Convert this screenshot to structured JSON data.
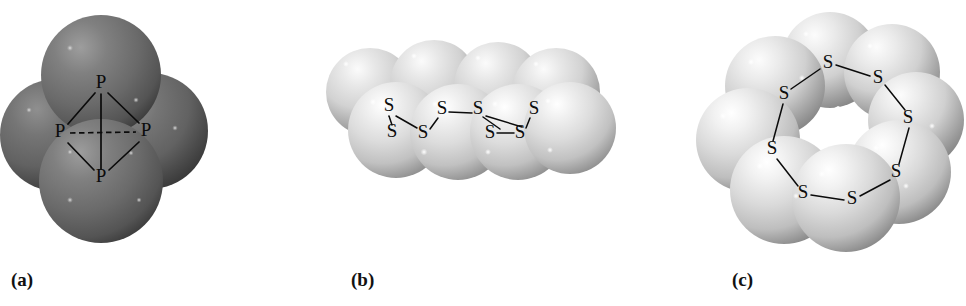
{
  "figure": {
    "background_color": "#ffffff",
    "width": 966,
    "height": 306,
    "panel_count": 3
  },
  "panels": [
    {
      "id": "a",
      "caption": "(a)",
      "molecule": "P4",
      "atom_symbol": "P",
      "atom_count": 4,
      "sphere_color": "#6e6e6e",
      "sphere_highlight_color": "#9a9a9a",
      "sphere_shadow_color": "#3b3b3b",
      "label_color": "#0c0c0c",
      "bond_color": "#0b0b0b",
      "geometry": "tetrahedron",
      "spheres": [
        {
          "cx": 101,
          "cy": 75,
          "r": 60
        },
        {
          "cx": 56,
          "cy": 135,
          "r": 56
        },
        {
          "cx": 150,
          "cy": 131,
          "r": 58
        },
        {
          "cx": 101,
          "cy": 181,
          "r": 62
        }
      ],
      "atoms": [
        {
          "symbol": "P",
          "x": 101,
          "y": 84,
          "name": "atom-p-top"
        },
        {
          "symbol": "P",
          "x": 60,
          "y": 133,
          "name": "atom-p-left"
        },
        {
          "symbol": "P",
          "x": 146,
          "y": 132,
          "name": "atom-p-right"
        },
        {
          "symbol": "P",
          "x": 101,
          "y": 178,
          "name": "atom-p-bottom"
        }
      ],
      "bonds": [
        {
          "from": "top",
          "to": "left",
          "style": "solid",
          "x1": 95,
          "y1": 93,
          "x2": 68,
          "y2": 124
        },
        {
          "from": "top",
          "to": "right",
          "style": "solid",
          "x1": 108,
          "y1": 93,
          "x2": 139,
          "y2": 123
        },
        {
          "from": "left",
          "to": "bottom",
          "style": "solid",
          "x1": 68,
          "y1": 143,
          "x2": 94,
          "y2": 170
        },
        {
          "from": "right",
          "to": "bottom",
          "style": "solid",
          "x1": 139,
          "y1": 142,
          "x2": 109,
          "y2": 170
        },
        {
          "from": "top",
          "to": "bottom",
          "style": "solid",
          "x1": 101,
          "y1": 94,
          "x2": 101,
          "y2": 169
        },
        {
          "from": "left",
          "to": "right",
          "style": "dashed",
          "x1": 70,
          "y1": 133,
          "x2": 136,
          "y2": 132
        }
      ]
    },
    {
      "id": "b",
      "caption": "(b)",
      "molecule": "S8",
      "atom_symbol": "S",
      "atom_count": 8,
      "view": "side view of crown ring",
      "sphere_color": "#d4d4d4",
      "sphere_highlight_color": "#fcfcfc",
      "sphere_shadow_color": "#8d8d8d",
      "label_color": "#0c0c0c",
      "bond_color": "#0b0b0b",
      "spheres": [
        {
          "cx": 48,
          "cy": 92,
          "r": 44,
          "row": "back"
        },
        {
          "cx": 112,
          "cy": 84,
          "r": 44,
          "row": "back"
        },
        {
          "cx": 176,
          "cy": 86,
          "r": 44,
          "row": "back"
        },
        {
          "cx": 234,
          "cy": 92,
          "r": 44,
          "row": "back"
        },
        {
          "cx": 74,
          "cy": 130,
          "r": 48,
          "row": "front"
        },
        {
          "cx": 136,
          "cy": 132,
          "r": 48,
          "row": "front"
        },
        {
          "cx": 196,
          "cy": 132,
          "r": 48,
          "row": "front"
        },
        {
          "cx": 246,
          "cy": 128,
          "r": 46,
          "row": "front"
        }
      ],
      "atoms": [
        {
          "symbol": "S",
          "x": 67,
          "y": 107,
          "name": "atom-s-1"
        },
        {
          "symbol": "S",
          "x": 70,
          "y": 133,
          "name": "atom-s-2"
        },
        {
          "symbol": "S",
          "x": 101,
          "y": 134,
          "name": "atom-s-3"
        },
        {
          "symbol": "S",
          "x": 120,
          "y": 110,
          "name": "atom-s-4"
        },
        {
          "symbol": "S",
          "x": 156,
          "y": 110,
          "name": "atom-s-5"
        },
        {
          "symbol": "S",
          "x": 168,
          "y": 134,
          "name": "atom-s-6"
        },
        {
          "symbol": "S",
          "x": 198,
          "y": 134,
          "name": "atom-s-7"
        },
        {
          "symbol": "S",
          "x": 207,
          "y": 110,
          "name": "atom-s-8"
        }
      ],
      "bonds": [
        {
          "x1": 67,
          "y1": 116,
          "x2": 70,
          "y2": 125
        },
        {
          "x1": 74,
          "y1": 116,
          "x2": 95,
          "y2": 128
        },
        {
          "x1": 108,
          "y1": 129,
          "x2": 115,
          "y2": 118
        },
        {
          "x1": 127,
          "y1": 112,
          "x2": 150,
          "y2": 113
        },
        {
          "x1": 161,
          "y1": 117,
          "x2": 180,
          "y2": 129
        },
        {
          "x1": 175,
          "y1": 133,
          "x2": 191,
          "y2": 133
        },
        {
          "x1": 204,
          "y1": 128,
          "x2": 207,
          "y2": 118
        },
        {
          "x1": 196,
          "y1": 129,
          "x2": 164,
          "y2": 117
        }
      ]
    },
    {
      "id": "c",
      "caption": "(c)",
      "molecule": "S8",
      "atom_symbol": "S",
      "atom_count": 8,
      "view": "top view of crown ring with central hole",
      "sphere_color": "#d2d2d2",
      "sphere_highlight_color": "#fcfcfc",
      "sphere_shadow_color": "#8a8a8a",
      "label_color": "#0c0c0c",
      "bond_color": "#0b0b0b",
      "hole": {
        "cx": 194,
        "cy": 122,
        "r": 15,
        "color": "#ffffff"
      },
      "spheres": [
        {
          "cx": 186,
          "cy": 60,
          "r": 48,
          "layer": "back"
        },
        {
          "cx": 248,
          "cy": 72,
          "r": 48,
          "layer": "back"
        },
        {
          "cx": 131,
          "cy": 86,
          "r": 50,
          "layer": "mid"
        },
        {
          "cx": 272,
          "cy": 120,
          "r": 48,
          "layer": "mid"
        },
        {
          "cx": 104,
          "cy": 140,
          "r": 52,
          "layer": "mid"
        },
        {
          "cx": 255,
          "cy": 172,
          "r": 52,
          "layer": "front"
        },
        {
          "cx": 140,
          "cy": 190,
          "r": 54,
          "layer": "front"
        },
        {
          "cx": 202,
          "cy": 198,
          "r": 54,
          "layer": "front"
        }
      ],
      "atoms": [
        {
          "symbol": "S",
          "x": 184,
          "y": 64,
          "name": "atom-s-1"
        },
        {
          "symbol": "S",
          "x": 234,
          "y": 79,
          "name": "atom-s-2"
        },
        {
          "symbol": "S",
          "x": 264,
          "y": 119,
          "name": "atom-s-3"
        },
        {
          "symbol": "S",
          "x": 252,
          "y": 173,
          "name": "atom-s-4"
        },
        {
          "symbol": "S",
          "x": 208,
          "y": 199,
          "name": "atom-s-5"
        },
        {
          "symbol": "S",
          "x": 159,
          "y": 194,
          "name": "atom-s-6"
        },
        {
          "symbol": "S",
          "x": 128,
          "y": 150,
          "name": "atom-s-7"
        },
        {
          "symbol": "S",
          "x": 140,
          "y": 95,
          "name": "atom-s-8"
        }
      ],
      "bonds": [
        {
          "x1": 192,
          "y1": 65,
          "x2": 226,
          "y2": 76
        },
        {
          "x1": 241,
          "y1": 85,
          "x2": 261,
          "y2": 110
        },
        {
          "x1": 265,
          "y1": 128,
          "x2": 255,
          "y2": 164
        },
        {
          "x1": 246,
          "y1": 180,
          "x2": 216,
          "y2": 196
        },
        {
          "x1": 200,
          "y1": 199,
          "x2": 167,
          "y2": 195
        },
        {
          "x1": 154,
          "y1": 186,
          "x2": 133,
          "y2": 159
        },
        {
          "x1": 129,
          "y1": 141,
          "x2": 139,
          "y2": 104
        },
        {
          "x1": 147,
          "y1": 89,
          "x2": 176,
          "y2": 69
        }
      ]
    }
  ]
}
